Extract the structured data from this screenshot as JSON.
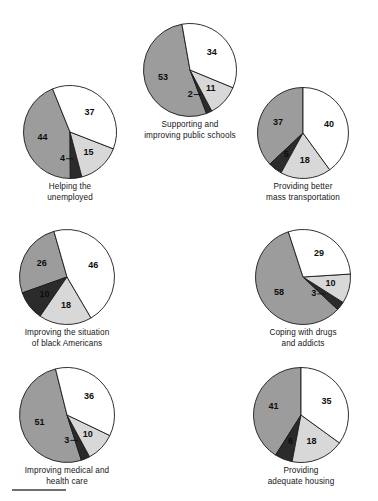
{
  "figure": {
    "background_color": "#ffffff",
    "footer_rule_color": "#6f6f6f"
  },
  "palette": {
    "slice_white": "#ffffff",
    "slice_light_gray": "#d8d8d8",
    "slice_dark_gray": "#9c9c9c",
    "slice_near_black": "#2b2b2b",
    "outline": "#1a1a1a",
    "label_text": "#0d0d0d",
    "caption_text": "#161616"
  },
  "chart_data": [
    {
      "type": "pie",
      "id": "helping-the-unemployed",
      "title": "Helping the\nunemployed",
      "categories": [
        "44",
        "4",
        "15",
        "37"
      ],
      "values": [
        44,
        4,
        15,
        37
      ],
      "colors": [
        "#9c9c9c",
        "#2b2b2b",
        "#d8d8d8",
        "#ffffff"
      ],
      "labels": [
        "44",
        "4",
        "15",
        "37"
      ],
      "start_angle": -22,
      "direction": "counterclockwise",
      "total": 100
    },
    {
      "type": "pie",
      "id": "supporting-and-improving-public-schools",
      "title": "Supporting and\nimproving public schools",
      "categories": [
        "53",
        "2",
        "11",
        "34"
      ],
      "values": [
        53,
        2,
        11,
        34
      ],
      "colors": [
        "#9c9c9c",
        "#2b2b2b",
        "#d8d8d8",
        "#ffffff"
      ],
      "labels": [
        "53",
        "2",
        "11",
        "34"
      ],
      "start_angle": -10,
      "direction": "counterclockwise",
      "total": 100
    },
    {
      "type": "pie",
      "id": "providing-better-mass-transportation",
      "title": "Providing better\nmass transportation",
      "categories": [
        "37",
        "5",
        "18",
        "40"
      ],
      "values": [
        37,
        5,
        18,
        40
      ],
      "colors": [
        "#9c9c9c",
        "#2b2b2b",
        "#d8d8d8",
        "#ffffff"
      ],
      "labels": [
        "37",
        "5",
        "18",
        "40"
      ],
      "start_angle": 0,
      "direction": "counterclockwise",
      "total": 100
    },
    {
      "type": "pie",
      "id": "improving-the-situation-of-black-americans",
      "title": "Improving the situation\nof black Americans",
      "categories": [
        "26",
        "10",
        "18",
        "46"
      ],
      "values": [
        26,
        10,
        18,
        46
      ],
      "colors": [
        "#9c9c9c",
        "#2b2b2b",
        "#d8d8d8",
        "#ffffff"
      ],
      "labels": [
        "26",
        "10",
        "18",
        "46"
      ],
      "start_angle": -16,
      "direction": "counterclockwise",
      "total": 100
    },
    {
      "type": "pie",
      "id": "coping-with-drugs-and-addicts",
      "title": "Coping with drugs\nand addicts",
      "categories": [
        "58",
        "3",
        "10",
        "29"
      ],
      "values": [
        58,
        3,
        10,
        29
      ],
      "colors": [
        "#9c9c9c",
        "#2b2b2b",
        "#d8d8d8",
        "#ffffff"
      ],
      "labels": [
        "58",
        "3",
        "10",
        "29"
      ],
      "start_angle": -18,
      "direction": "counterclockwise",
      "total": 100
    },
    {
      "type": "pie",
      "id": "improving-medical-and-health-care",
      "title": "Improving medical and\nhealth care",
      "categories": [
        "51",
        "3",
        "10",
        "36"
      ],
      "values": [
        51,
        3,
        10,
        36
      ],
      "colors": [
        "#9c9c9c",
        "#2b2b2b",
        "#d8d8d8",
        "#ffffff"
      ],
      "labels": [
        "51",
        "3",
        "10",
        "36"
      ],
      "start_angle": -14,
      "direction": "counterclockwise",
      "total": 100
    },
    {
      "type": "pie",
      "id": "providing-adequate-housing",
      "title": "Providing\nadequate housing",
      "categories": [
        "41",
        "6",
        "18",
        "35"
      ],
      "values": [
        41,
        6,
        18,
        35
      ],
      "colors": [
        "#9c9c9c",
        "#2b2b2b",
        "#d8d8d8",
        "#ffffff"
      ],
      "labels": [
        "41",
        "6",
        "18",
        "35"
      ],
      "start_angle": 0,
      "direction": "counterclockwise",
      "total": 100
    }
  ],
  "layout": [
    {
      "left": 22,
      "top": 84,
      "size": 96
    },
    {
      "left": 142,
      "top": 22,
      "size": 96
    },
    {
      "left": 256,
      "top": 86,
      "size": 94
    },
    {
      "left": 18,
      "top": 228,
      "size": 98
    },
    {
      "left": 254,
      "top": 228,
      "size": 98
    },
    {
      "left": 18,
      "top": 366,
      "size": 98
    },
    {
      "left": 252,
      "top": 366,
      "size": 98
    }
  ]
}
